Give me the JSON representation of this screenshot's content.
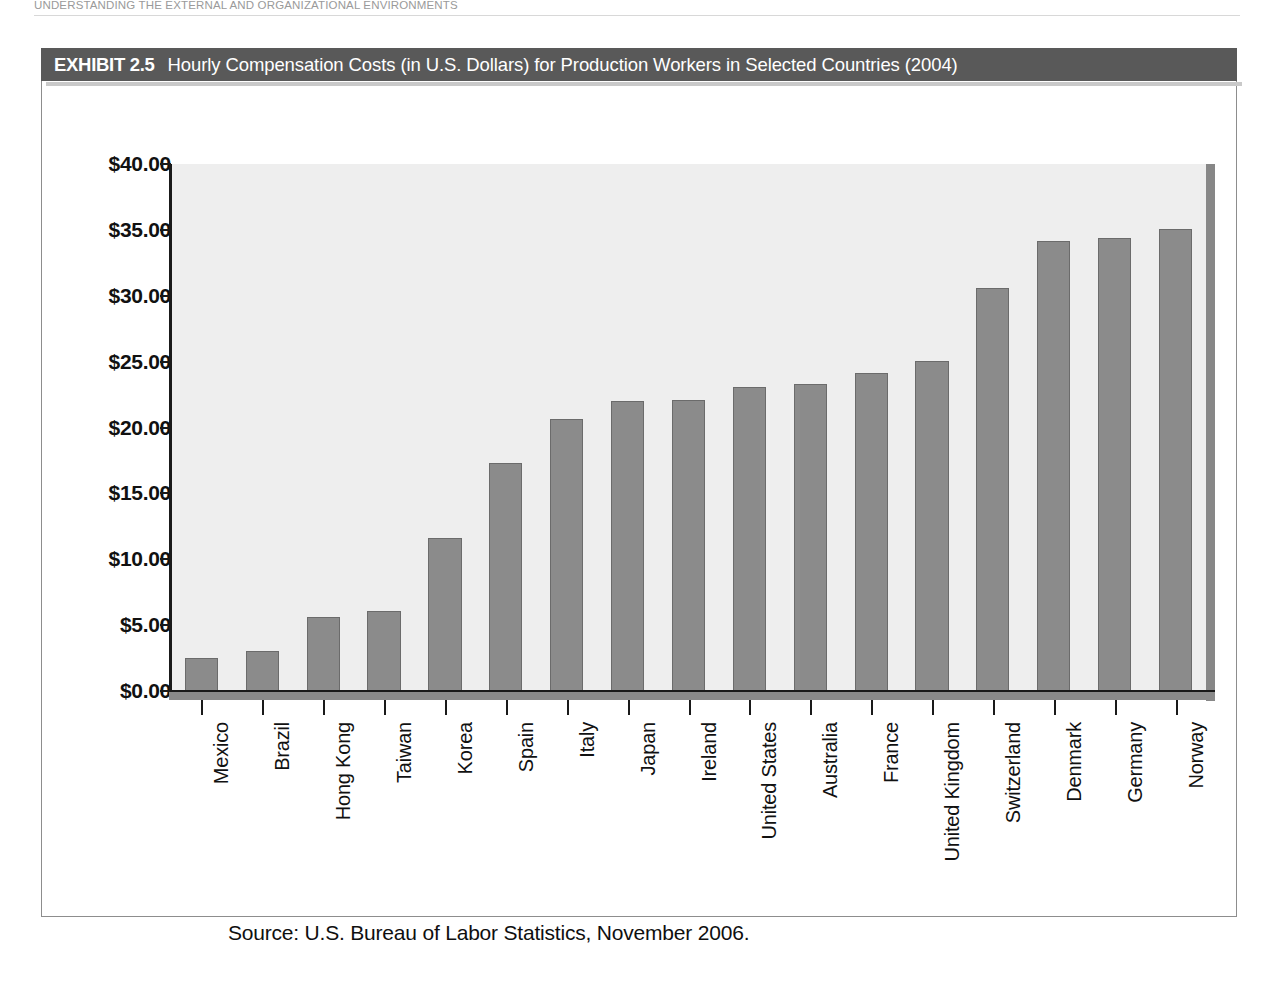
{
  "page": {
    "running_head": "UNDERSTANDING THE EXTERNAL AND ORGANIZATIONAL ENVIRONMENTS"
  },
  "exhibit": {
    "number_label": "EXHIBIT 2.5",
    "title": "Hourly Compensation Costs (in U.S. Dollars) for Production Workers in Selected Countries (2004)",
    "source_note": "Source: U.S. Bureau of Labor Statistics, November 2006.",
    "titlebar_color": "#595959",
    "bar_color": "#8b8b8b",
    "plot_background_color": "#eeeeee"
  },
  "chart_data": {
    "type": "bar",
    "title": "Hourly Compensation Costs (in U.S. Dollars) for Production Workers in Selected Countries (2004)",
    "xlabel": "",
    "ylabel": "",
    "ylim": [
      0,
      40
    ],
    "grid": false,
    "legend": "none",
    "yticks": [
      0,
      5,
      10,
      15,
      20,
      25,
      30,
      35,
      40
    ],
    "ytick_labels": [
      "$0.00",
      "$5.00",
      "$10.00",
      "$15.00",
      "$20.00",
      "$25.00",
      "$30.00",
      "$35.00",
      "$40.00"
    ],
    "categories": [
      "Mexico",
      "Brazil",
      "Hong Kong",
      "Taiwan",
      "Korea",
      "Spain",
      "Italy",
      "Japan",
      "Ireland",
      "United States",
      "Australia",
      "France",
      "United Kingdom",
      "Switzerland",
      "Denmark",
      "Germany",
      "Norway"
    ],
    "values": [
      2.5,
      3.03,
      5.62,
      6.07,
      11.62,
      17.28,
      20.65,
      22.0,
      22.1,
      23.1,
      23.33,
      24.13,
      25.05,
      30.57,
      34.16,
      34.42,
      35.09
    ],
    "value_labels": [
      "$2.50",
      "$3.03",
      "$5.62",
      "$6.07",
      "$11.62",
      "$17.28",
      "$20.65",
      "$22.00",
      "$22.10",
      "$23.10",
      "$23.33",
      "$24.13",
      "$25.05",
      "$30.57",
      "$34.16",
      "$34.42",
      "$35.09"
    ],
    "source": "U.S. Bureau of Labor Statistics, November 2006."
  }
}
